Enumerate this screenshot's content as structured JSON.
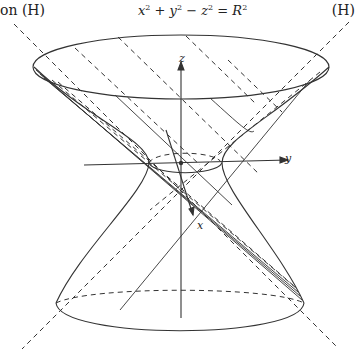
{
  "labels": {
    "left_asymptote": "on (H)",
    "right_asymptote": "(H)",
    "equation": "x² + y² − z² = R²",
    "equation_parts": {
      "a": "x",
      "b": "y",
      "c": "z",
      "r": "R",
      "exp": "2"
    }
  },
  "axes": {
    "x": "x",
    "y": "y",
    "z": "z"
  },
  "figure": {
    "type": "hyperboloid-of-one-sheet",
    "stroke_color": "#333333",
    "background": "#ffffff"
  }
}
